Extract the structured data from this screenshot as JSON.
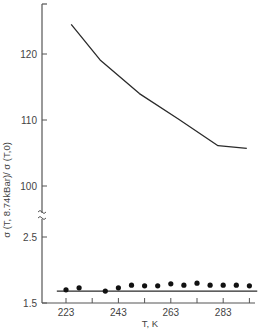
{
  "chart_data": {
    "type": "line",
    "title": "",
    "xlabel": "T, K",
    "ylabel": "σ (T, 8.74kBar)/ σ (T,0)",
    "broken_y_axis": true,
    "x_ticks": [
      223,
      243,
      263,
      283
    ],
    "x_minor_ticks": [
      233,
      253,
      273,
      293
    ],
    "xlim": [
      219.5,
      296
    ],
    "upper_panel": {
      "y_ticks": [
        100,
        110,
        120
      ],
      "ylim": [
        95.5,
        127
      ],
      "series": [
        {
          "name": "upper curve",
          "style": "line",
          "x": [
            225,
            236,
            251,
            266,
            281,
            292
          ],
          "y": [
            124.5,
            119.1,
            114.0,
            110.1,
            106.1,
            105.7
          ]
        }
      ]
    },
    "lower_panel": {
      "y_ticks": [
        1.5,
        2.5
      ],
      "ylim": [
        1.5,
        2.6
      ],
      "series": [
        {
          "name": "fit line",
          "style": "line",
          "x": [
            219.5,
            296
          ],
          "y": [
            1.68,
            1.68
          ]
        },
        {
          "name": "measured points",
          "style": "scatter",
          "x": [
            223,
            228,
            238,
            243,
            248,
            253,
            258,
            263,
            268,
            273,
            278,
            283,
            288,
            293
          ],
          "y": [
            1.7,
            1.73,
            1.68,
            1.73,
            1.77,
            1.76,
            1.76,
            1.79,
            1.77,
            1.8,
            1.77,
            1.77,
            1.77,
            1.76
          ]
        }
      ]
    },
    "grid": false,
    "legend": null
  },
  "axes": {
    "x_label": "T, K",
    "y_label": "σ (T, 8.74kBar)/ σ (T,0)",
    "x_tick_labels": [
      "223",
      "243",
      "263",
      "283"
    ],
    "y_tick_labels_upper": [
      "120",
      "110",
      "100"
    ],
    "y_tick_labels_lower": [
      "2.5",
      "1.5"
    ]
  },
  "colors": {
    "line": "#2a2a2a",
    "axis": "#555555",
    "points": "#111111"
  }
}
